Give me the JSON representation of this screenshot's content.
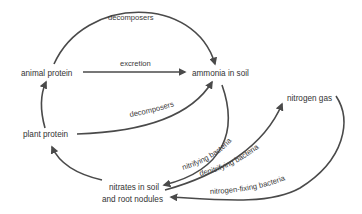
{
  "diagram": {
    "type": "nitrogen-cycle",
    "colors": {
      "stroke": "#4a4a4a",
      "text": "#333333",
      "background": "#ffffff"
    },
    "nodes": {
      "animal_protein": "animal protein",
      "ammonia_in_soil": "ammonia in soil",
      "plant_protein": "plant protein",
      "nitrogen_gas": "nitrogen gas",
      "nitrates_line1": "nitrates in soil",
      "nitrates_line2": "and root nodules"
    },
    "edges": [
      {
        "from": "animal protein",
        "to": "ammonia in soil",
        "label": "decomposers"
      },
      {
        "from": "animal protein",
        "to": "ammonia in soil",
        "label": "excretion"
      },
      {
        "from": "plant protein",
        "to": "ammonia in soil",
        "label": "decomposers"
      },
      {
        "from": "plant protein",
        "to": "animal protein",
        "label": ""
      },
      {
        "from": "nitrates in soil and root nodules",
        "to": "plant protein",
        "label": ""
      },
      {
        "from": "ammonia in soil",
        "to": "nitrates in soil and root nodules",
        "label": "nitrifying bacteria"
      },
      {
        "from": "nitrates in soil and root nodules",
        "to": "nitrogen gas",
        "label": "denitrifying bacteria"
      },
      {
        "from": "nitrogen gas",
        "to": "nitrates in soil and root nodules",
        "label": "nitrogen-fixing bacteria"
      }
    ],
    "labels": {
      "decomposers_top": "decomposers",
      "excretion": "excretion",
      "decomposers_mid": "decomposers",
      "nitrifying": "nitrifying bacteria",
      "denitrifying": "denitrifying bacteria",
      "nitrogen_fixing": "nitrogen-fixing bacteria"
    }
  }
}
